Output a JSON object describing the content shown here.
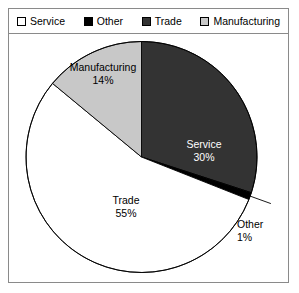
{
  "frame": {
    "border_color": "#8a8a8a",
    "background": "#ffffff"
  },
  "legend": {
    "items": [
      {
        "label": "Service",
        "swatch_color": "#ffffff",
        "swatch_name": "legend-swatch-service"
      },
      {
        "label": "Other",
        "swatch_color": "#000000",
        "swatch_name": "legend-swatch-other"
      },
      {
        "label": "Trade",
        "swatch_color": "#333333",
        "swatch_name": "legend-swatch-trade"
      },
      {
        "label": "Manufacturing",
        "swatch_color": "#c8c8c8",
        "swatch_name": "legend-swatch-manufacturing"
      }
    ]
  },
  "labels": {
    "service": {
      "name": "Service",
      "pct": "30%"
    },
    "other": {
      "name": "Other",
      "pct": "1%"
    },
    "trade": {
      "name": "Trade",
      "pct": "55%"
    },
    "manufacturing": {
      "name": "Manufacturing",
      "pct": "14%"
    }
  },
  "chart_data": {
    "type": "pie",
    "title": "",
    "categories": [
      "Service",
      "Other",
      "Trade",
      "Manufacturing"
    ],
    "values": [
      30,
      1,
      55,
      14
    ],
    "value_labels": [
      "30%",
      "1%",
      "55%",
      "14%"
    ],
    "units": "percent",
    "total": 100,
    "start_angle_deg": 0,
    "direction": "clockwise",
    "slice_colors": [
      "#333333",
      "#000000",
      "#ffffff",
      "#c8c8c8"
    ],
    "slice_stroke": "#000000",
    "legend_position": "top",
    "legend_entries": [
      "Service",
      "Other",
      "Trade",
      "Manufacturing"
    ],
    "grid": false,
    "labels_inside": [
      "Service",
      "Trade",
      "Manufacturing"
    ],
    "labels_outside": [
      "Other"
    ],
    "xlabel": "",
    "ylabel": ""
  }
}
